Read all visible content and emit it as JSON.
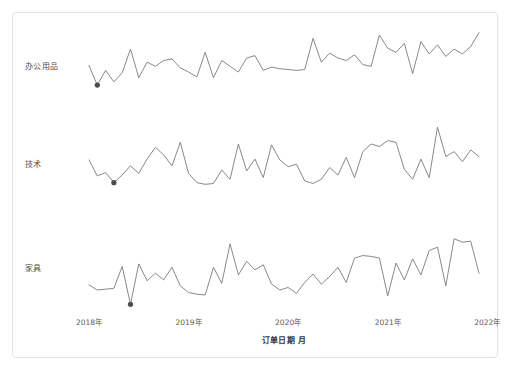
{
  "chart_data": {
    "type": "line",
    "title": "",
    "subtitle": "",
    "xlabel": "订单日期 月",
    "ylabel": "",
    "grid": false,
    "legend_position": "left-row-labels",
    "layout": "small-multiples-stacked",
    "x_axis": {
      "tick_labels": [
        "2018年",
        "2019年",
        "2020年",
        "2021年",
        "2022年"
      ],
      "tick_values": [
        2018,
        2019,
        2020,
        2021,
        2022
      ],
      "range": [
        "2018-01",
        "2021-12"
      ],
      "granularity": "month"
    },
    "x": [
      "2018-01",
      "2018-02",
      "2018-03",
      "2018-04",
      "2018-05",
      "2018-06",
      "2018-07",
      "2018-08",
      "2018-09",
      "2018-10",
      "2018-11",
      "2018-12",
      "2019-01",
      "2019-02",
      "2019-03",
      "2019-04",
      "2019-05",
      "2019-06",
      "2019-07",
      "2019-08",
      "2019-09",
      "2019-10",
      "2019-11",
      "2019-12",
      "2020-01",
      "2020-02",
      "2020-03",
      "2020-04",
      "2020-05",
      "2020-06",
      "2020-07",
      "2020-08",
      "2020-09",
      "2020-10",
      "2020-11",
      "2020-12",
      "2021-01",
      "2021-02",
      "2021-03",
      "2021-04",
      "2021-05",
      "2021-06",
      "2021-07",
      "2021-08",
      "2021-09",
      "2021-10",
      "2021-11",
      "2021-12"
    ],
    "series": [
      {
        "name": "办公用品",
        "panel": 0,
        "ylim": [
          0,
          100
        ],
        "marker_index": 1,
        "marker_label": "2018-02",
        "values": [
          58,
          34,
          52,
          38,
          49,
          78,
          43,
          62,
          57,
          64,
          66,
          55,
          50,
          44,
          74,
          43,
          64,
          57,
          50,
          67,
          70,
          52,
          56,
          54,
          53,
          52,
          53,
          91,
          62,
          73,
          67,
          64,
          71,
          59,
          57,
          95,
          79,
          74,
          85,
          48,
          87,
          72,
          83,
          69,
          78,
          72,
          81,
          98
        ]
      },
      {
        "name": "技术",
        "panel": 1,
        "ylim": [
          0,
          100
        ],
        "marker_index": 3,
        "marker_label": "2018-04",
        "values": [
          56,
          37,
          41,
          29,
          38,
          49,
          40,
          57,
          71,
          62,
          49,
          77,
          40,
          29,
          27,
          28,
          44,
          33,
          75,
          43,
          57,
          35,
          74,
          56,
          48,
          51,
          31,
          28,
          33,
          47,
          38,
          59,
          35,
          66,
          75,
          72,
          79,
          77,
          45,
          33,
          57,
          35,
          95,
          60,
          66,
          54,
          68,
          60
        ]
      },
      {
        "name": "家具",
        "panel": 2,
        "ylim": [
          0,
          100
        ],
        "marker_index": 5,
        "marker_label": "2018-06",
        "values": [
          31,
          25,
          26,
          27,
          53,
          8,
          56,
          36,
          45,
          37,
          52,
          30,
          22,
          20,
          19,
          52,
          33,
          80,
          43,
          59,
          49,
          55,
          32,
          25,
          28,
          21,
          34,
          44,
          32,
          41,
          52,
          34,
          63,
          66,
          65,
          63,
          18,
          57,
          37,
          62,
          43,
          72,
          76,
          30,
          86,
          82,
          83,
          45
        ]
      }
    ],
    "style": {
      "line_color": "#7b7b80",
      "marker_color": "#4c4c50",
      "text_color": "#4a4a4a",
      "background": "#ffffff",
      "card_border": "#e3e3e5"
    }
  }
}
